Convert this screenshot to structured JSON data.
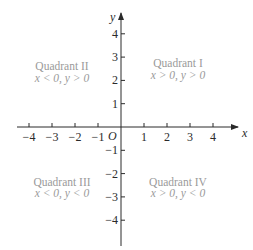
{
  "diagram": {
    "type": "cartesian-plane",
    "axes": {
      "x_label": "x",
      "y_label": "y",
      "origin_label": "O",
      "x_ticks": [
        {
          "value": -4,
          "label": "−4"
        },
        {
          "value": -3,
          "label": "−3"
        },
        {
          "value": -2,
          "label": "−2"
        },
        {
          "value": -1,
          "label": "−1"
        },
        {
          "value": 1,
          "label": "1"
        },
        {
          "value": 2,
          "label": "2"
        },
        {
          "value": 3,
          "label": "3"
        },
        {
          "value": 4,
          "label": "4"
        }
      ],
      "y_ticks": [
        {
          "value": 4,
          "label": "4"
        },
        {
          "value": 3,
          "label": "3"
        },
        {
          "value": 2,
          "label": "2"
        },
        {
          "value": 1,
          "label": "1"
        },
        {
          "value": -1,
          "label": "−1"
        },
        {
          "value": -2,
          "label": "−2"
        },
        {
          "value": -3,
          "label": "−3"
        },
        {
          "value": -4,
          "label": "−4"
        }
      ]
    },
    "quadrants": {
      "q1": {
        "title": "Quadrant I",
        "condition": "x > 0, y > 0"
      },
      "q2": {
        "title": "Quadrant II",
        "condition": "x < 0, y > 0"
      },
      "q3": {
        "title": "Quadrant III",
        "condition": "x < 0, y < 0"
      },
      "q4": {
        "title": "Quadrant IV",
        "condition": "x > 0, y < 0"
      }
    },
    "colors": {
      "axis": "#2a2a2a",
      "quadrant_text": "#9a9a9a",
      "background": "#ffffff"
    }
  }
}
